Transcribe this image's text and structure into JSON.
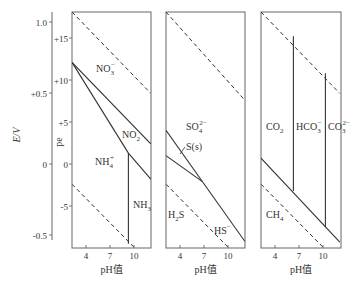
{
  "chart_data": [
    {
      "type": "line",
      "panel": "nitrogen",
      "title": "",
      "xlabel": "pH值",
      "ylabel": "pe",
      "secondary_ylabel": "E/V",
      "x_ticks": [
        4,
        7,
        10
      ],
      "y_ticks": [
        "+15",
        "+10",
        "+5",
        "0",
        "-5"
      ],
      "secondary_y_ticks": [
        "1.0",
        "+0.5",
        "0",
        "-0.5"
      ],
      "xlim": [
        2.25,
        12.1
      ],
      "ylim": [
        -10,
        18.1
      ],
      "regions": [
        "NO3-",
        "NO2-",
        "NH4+",
        "NH3"
      ],
      "series": [
        {
          "name": "O2/H2O upper stability (dashed)",
          "style": "dashed",
          "points": [
            [
              2.25,
              18.1
            ],
            [
              12.1,
              8.4
            ]
          ]
        },
        {
          "name": "NO3-/NO2- boundary",
          "style": "solid",
          "points": [
            [
              2.25,
              12.1
            ],
            [
              12.1,
              2.4
            ]
          ]
        },
        {
          "name": "NO3-/NH4+ & NO2-/NH4+ boundary",
          "style": "solid",
          "points": [
            [
              2.25,
              12.1
            ],
            [
              9.3,
              1.3
            ]
          ]
        },
        {
          "name": "NO2-/NH3 boundary",
          "style": "solid",
          "points": [
            [
              9.3,
              1.3
            ],
            [
              12.1,
              -1.8
            ]
          ]
        },
        {
          "name": "NH4+/NH3 boundary (pH 9.3)",
          "style": "solid",
          "points": [
            [
              9.3,
              1.3
            ],
            [
              9.3,
              -9.5
            ]
          ]
        },
        {
          "name": "H2O/H2 lower stability (dashed)",
          "style": "dashed",
          "points": [
            [
              2.25,
              -2.4
            ],
            [
              10.1,
              -10
            ]
          ]
        }
      ]
    },
    {
      "type": "line",
      "panel": "sulfur",
      "xlabel": "pH值",
      "x_ticks": [
        4,
        7,
        10
      ],
      "xlim": [
        2.25,
        12.1
      ],
      "ylim": [
        -10,
        18.1
      ],
      "regions": [
        "SO4 2-",
        "S(s)",
        "H2S",
        "HS-"
      ],
      "series": [
        {
          "name": "O2/H2O upper stability (dashed)",
          "style": "dashed",
          "points": [
            [
              2.25,
              18.1
            ],
            [
              12.1,
              7.6
            ]
          ]
        },
        {
          "name": "SO4 2-/S(s) & SO4 2-/HS- boundary",
          "style": "solid",
          "points": [
            [
              2.25,
              4.0
            ],
            [
              12.1,
              -9.2
            ]
          ]
        },
        {
          "name": "S(s)/H2S boundary",
          "style": "solid",
          "points": [
            [
              2.25,
              1.0
            ],
            [
              6.8,
              -2.1
            ]
          ]
        },
        {
          "name": "H2O/H2 lower stability (dashed)",
          "style": "dashed",
          "points": [
            [
              2.25,
              -2.4
            ],
            [
              10.1,
              -10
            ]
          ]
        }
      ]
    },
    {
      "type": "line",
      "panel": "carbon",
      "xlabel": "pH值",
      "x_ticks": [
        4,
        7,
        10
      ],
      "xlim": [
        2.25,
        12.1
      ],
      "ylim": [
        -10,
        18.1
      ],
      "regions": [
        "CO2",
        "HCO3-",
        "CO3 2-",
        "CH4"
      ],
      "series": [
        {
          "name": "O2/H2O upper stability (dashed)",
          "style": "dashed",
          "points": [
            [
              2.25,
              18.1
            ],
            [
              12.1,
              8.4
            ]
          ]
        },
        {
          "name": "CO2/HCO3- boundary (pH 6.3)",
          "style": "solid",
          "points": [
            [
              6.3,
              15.2
            ],
            [
              6.3,
              -3.2
            ]
          ]
        },
        {
          "name": "HCO3-/CO3 2- boundary (pH 10.3)",
          "style": "solid",
          "points": [
            [
              10.3,
              10.8
            ],
            [
              10.3,
              -7.5
            ]
          ]
        },
        {
          "name": "carbon species/CH4 boundary",
          "style": "solid",
          "points": [
            [
              2.25,
              0.7
            ],
            [
              12.1,
              -9.3
            ]
          ]
        },
        {
          "name": "H2O/H2 lower stability (dashed)",
          "style": "dashed",
          "points": [
            [
              2.25,
              -2.4
            ],
            [
              10.1,
              -10
            ]
          ]
        }
      ]
    }
  ],
  "axes": {
    "e_label": "E/V",
    "pe_label": "pe",
    "e_ticks": [
      {
        "label": "1.0",
        "y": 22
      },
      {
        "label": "+0.5",
        "y": 93
      },
      {
        "label": "0",
        "y": 164
      },
      {
        "label": "-0.5",
        "y": 235
      }
    ],
    "pe_ticks": [
      {
        "label": "+15",
        "y": 38
      },
      {
        "label": "+10",
        "y": 80
      },
      {
        "label": "+5",
        "y": 122
      },
      {
        "label": "0",
        "y": 164
      },
      {
        "label": "-5",
        "y": 206
      }
    ],
    "ph_ticks": [
      {
        "label": "4",
        "dx": 14
      },
      {
        "label": "7",
        "dx": 38
      },
      {
        "label": "10",
        "dx": 62
      }
    ],
    "ph_label": "pH值"
  },
  "panels": [
    {
      "id": "nitrogen",
      "x": 72,
      "w": 79,
      "labels": [
        {
          "text": "NO",
          "sub": "3",
          "sup": "−",
          "x": 96,
          "y": 72
        },
        {
          "text": "NO",
          "sub": "2",
          "sup": "",
          "x": 122,
          "y": 138
        },
        {
          "text": "NH",
          "sub": "4",
          "sup": "+",
          "x": 95,
          "y": 165
        },
        {
          "text": "NH",
          "sub": "3",
          "sup": "",
          "x": 133,
          "y": 208
        }
      ]
    },
    {
      "id": "sulfur",
      "x": 166,
      "w": 79,
      "labels": [
        {
          "text": "SO",
          "sub": "4",
          "sup": "2−",
          "x": 186,
          "y": 130
        },
        {
          "text": "S(s)",
          "sub": "",
          "sup": "",
          "x": 186,
          "y": 150
        },
        {
          "text": "H",
          "sub": "2",
          "sup": "",
          "text2": "S",
          "x": 168,
          "y": 218
        },
        {
          "text": "HS",
          "sub": "",
          "sup": "−",
          "x": 214,
          "y": 234
        }
      ]
    },
    {
      "id": "carbon",
      "x": 261,
      "w": 80,
      "labels": [
        {
          "text": "CO",
          "sub": "2",
          "sup": "",
          "x": 266,
          "y": 130
        },
        {
          "text": "HCO",
          "sub": "3",
          "sup": "−",
          "x": 296,
          "y": 130
        },
        {
          "text": "CO",
          "sub": "3",
          "sup": "2−",
          "x": 328,
          "y": 130
        },
        {
          "text": "CH",
          "sub": "4",
          "sup": "",
          "x": 266,
          "y": 218
        }
      ]
    }
  ],
  "layout": {
    "top": 12,
    "bottom": 248,
    "pe_zero_y": 164,
    "px_per_pe": 8.4,
    "ph_min": 2.25,
    "px_per_ph": 8
  }
}
